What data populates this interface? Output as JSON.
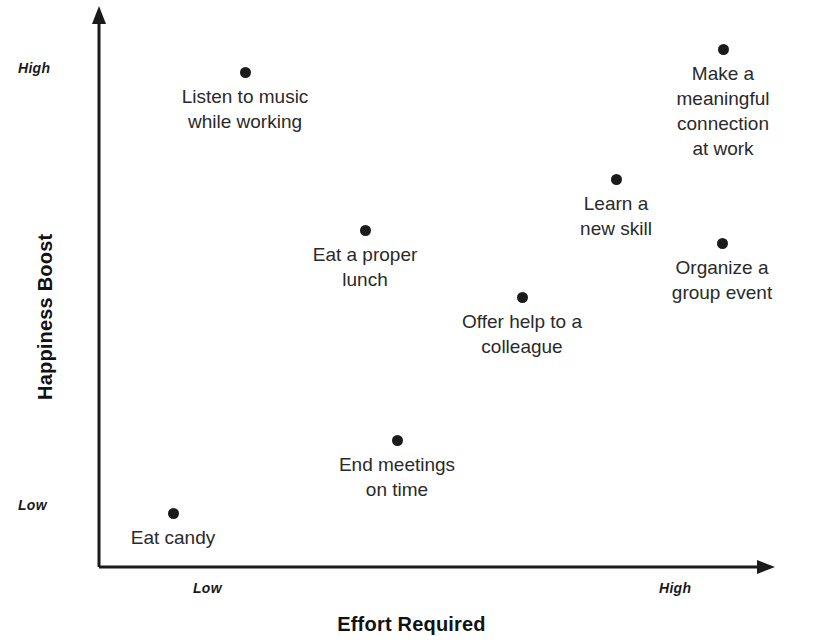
{
  "chart_data": {
    "type": "scatter",
    "title": "",
    "xlabel": "Effort Required",
    "ylabel": "Happiness Boost",
    "x_tick_labels": [
      "Low",
      "High"
    ],
    "y_tick_labels": [
      "High",
      "Low"
    ],
    "grid": false,
    "legend": "none",
    "xlim": [
      0,
      1
    ],
    "ylim": [
      0,
      1
    ],
    "points": [
      {
        "label": "Listen to music\nwhile working",
        "x": 0.216,
        "y": 0.887,
        "px": 245,
        "py": 72,
        "label_px": 245,
        "label_py": 84
      },
      {
        "label": "Make a meaningful\nconnection at work",
        "x": 0.923,
        "y": 0.929,
        "px": 723,
        "py": 49,
        "label_px": 723,
        "label_py": 61
      },
      {
        "label": "Learn a\nnew skill",
        "x": 0.765,
        "y": 0.695,
        "px": 616,
        "py": 179,
        "label_px": 616,
        "label_py": 191
      },
      {
        "label": "Eat a proper\nlunch",
        "x": 0.394,
        "y": 0.603,
        "px": 365,
        "py": 230,
        "label_px": 365,
        "label_py": 242
      },
      {
        "label": "Organize a\ngroup event",
        "x": 0.921,
        "y": 0.58,
        "px": 722,
        "py": 243,
        "label_px": 722,
        "label_py": 255
      },
      {
        "label": "Offer help to a\ncolleague",
        "x": 0.626,
        "y": 0.483,
        "px": 522,
        "py": 297,
        "label_px": 522,
        "label_py": 309
      },
      {
        "label": "End meetings\non time",
        "x": 0.441,
        "y": 0.228,
        "px": 397,
        "py": 440,
        "label_px": 397,
        "label_py": 452
      },
      {
        "label": "Eat candy",
        "x": 0.11,
        "y": 0.097,
        "px": 173,
        "py": 513,
        "label_px": 173,
        "label_py": 525
      }
    ]
  },
  "axes": {
    "y_title": "Happiness Boost",
    "x_title": "Effort Required",
    "y_high_label": "High",
    "y_low_label": "Low",
    "x_low_label": "Low",
    "x_high_label": "High",
    "line_color": "#1b1b1b"
  }
}
